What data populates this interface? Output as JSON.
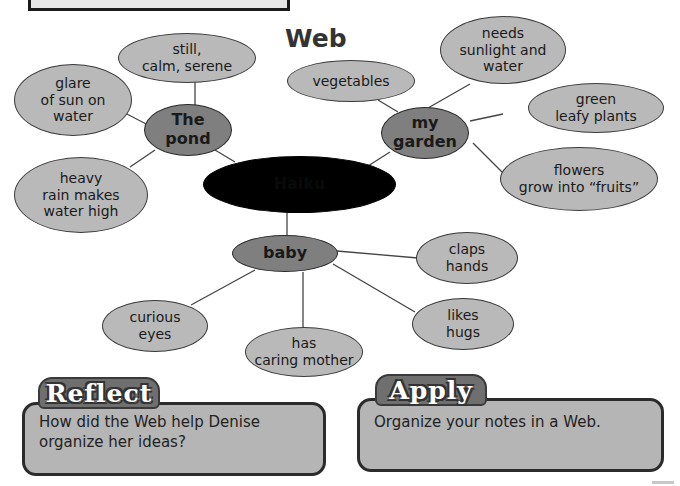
{
  "header": {
    "title": "Web"
  },
  "web": {
    "center": {
      "label": "Haiku"
    },
    "hubs": [
      {
        "id": "pond",
        "label": "The\npond"
      },
      {
        "id": "garden",
        "label": "my\ngarden"
      },
      {
        "id": "baby",
        "label": "baby"
      }
    ],
    "pond_details": [
      {
        "label": "still,\ncalm, serene"
      },
      {
        "label": "glare\nof sun on\nwater"
      },
      {
        "label": "heavy\nrain makes\nwater high"
      }
    ],
    "garden_details": [
      {
        "label": "vegetables"
      },
      {
        "label": "needs\nsunlight and\nwater"
      },
      {
        "label": "green\nleafy plants"
      },
      {
        "label": "flowers\ngrow into “fruits”"
      }
    ],
    "baby_details": [
      {
        "label": "claps\nhands"
      },
      {
        "label": "likes\nhugs"
      },
      {
        "label": "has\ncaring mother"
      },
      {
        "label": "curious\neyes"
      }
    ]
  },
  "reflect": {
    "heading": "Reflect",
    "text": "How did the Web help Denise\norganize her ideas?"
  },
  "apply": {
    "heading": "Apply",
    "text": "Organize your notes in a Web."
  },
  "colors": {
    "leaf": "#b9b9b9",
    "hub": "#7f7f7f",
    "center": "#000000",
    "panel": "#b5b5b5",
    "tab": "#6f6f6f"
  }
}
